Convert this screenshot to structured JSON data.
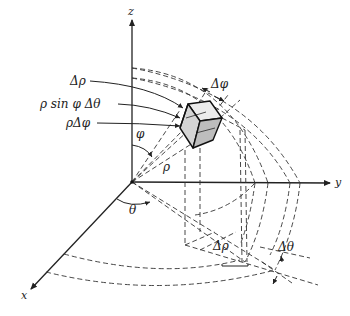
{
  "figure": {
    "axes": {
      "x": "x",
      "y": "y",
      "z": "z"
    },
    "labels": {
      "delta_rho_top": "Δρ",
      "rho_sin_phi_dtheta": "ρ sin φ Δθ",
      "rho_delta_phi": "ρΔφ",
      "phi": "φ",
      "rho": "ρ",
      "theta": "θ",
      "delta_phi": "Δφ",
      "delta_rho_bottom": "Δρ",
      "delta_theta": "Δθ"
    },
    "colors": {
      "line": "#222222",
      "box_fill_light": "#e8e8e8",
      "box_fill_dark": "#bdbdbd",
      "background": "#ffffff"
    }
  }
}
